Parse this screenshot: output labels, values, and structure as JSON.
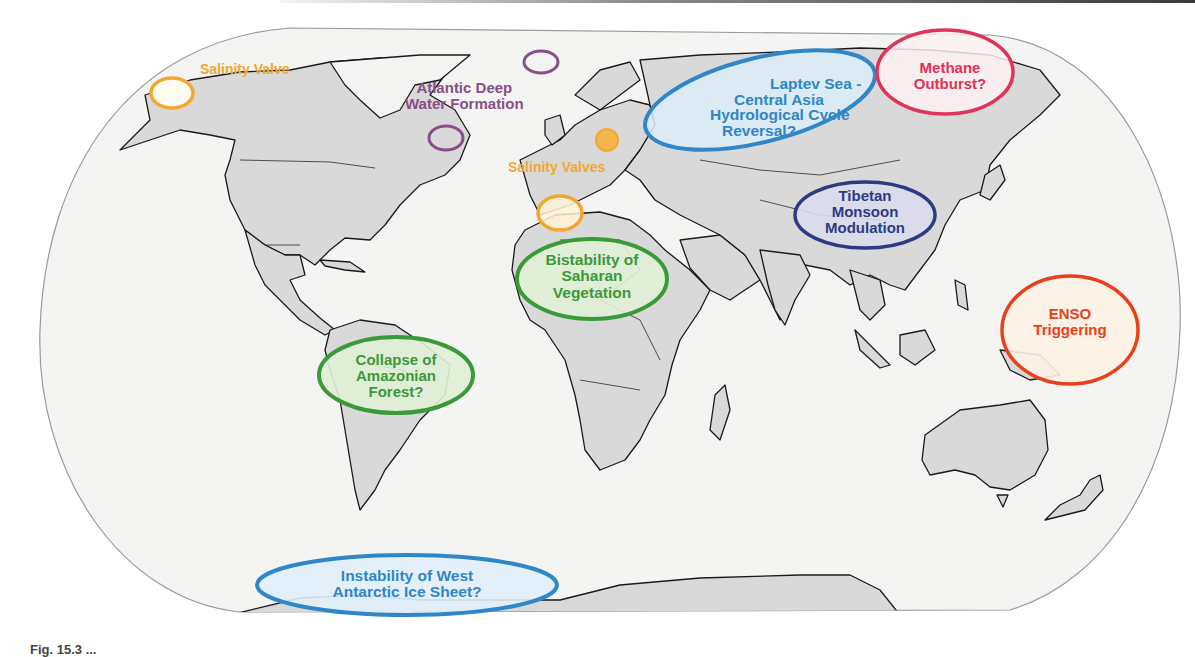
{
  "figure": {
    "type": "world map",
    "caption_visible_fragment": "Fig. 15.3 ..."
  },
  "colors": {
    "ocean": "#f4f4f2",
    "land": "#d9d9d9",
    "border": "#1a1a1a",
    "salinity": "#f0a830",
    "deepwater": "#8a4f86",
    "hydro": "#2f86c8",
    "methane": "#e0335a",
    "monsoon": "#2d3b83",
    "green": "#3a9a3a",
    "enso": "#e8401a"
  },
  "tipping_elements": [
    {
      "id": "salinity-valve-bering",
      "label_lines": [
        "Salinity Valve"
      ],
      "color": "#f0a830"
    },
    {
      "id": "atlantic-deep-water",
      "label_lines": [
        "Atlantic Deep",
        "Water Formation"
      ],
      "color": "#8a4f86"
    },
    {
      "id": "salinity-valves-europe",
      "label_lines": [
        "Salinity Valves"
      ],
      "color": "#f0a830"
    },
    {
      "id": "laptev-central-asia",
      "label_lines": [
        "Laptev Sea -",
        "Central Asia",
        "Hydrological Cycle",
        "Reversal?"
      ],
      "color": "#2f86c8"
    },
    {
      "id": "methane-outburst",
      "label_lines": [
        "Methane",
        "Outburst?"
      ],
      "color": "#e0335a"
    },
    {
      "id": "tibetan-monsoon",
      "label_lines": [
        "Tibetan",
        "Monsoon",
        "Modulation"
      ],
      "color": "#2d3b83"
    },
    {
      "id": "saharan-vegetation",
      "label_lines": [
        "Bistability of",
        "Saharan",
        "Vegetation"
      ],
      "color": "#3a9a3a"
    },
    {
      "id": "enso-triggering",
      "label_lines": [
        "ENSO",
        "Triggering"
      ],
      "color": "#e8401a"
    },
    {
      "id": "amazonian-forest",
      "label_lines": [
        "Collapse of",
        "Amazonian",
        "Forest?"
      ],
      "color": "#3a9a3a"
    },
    {
      "id": "west-antarctic-ice",
      "label_lines": [
        "Instability of West",
        "Antarctic Ice Sheet?"
      ],
      "color": "#2f86c8"
    }
  ]
}
